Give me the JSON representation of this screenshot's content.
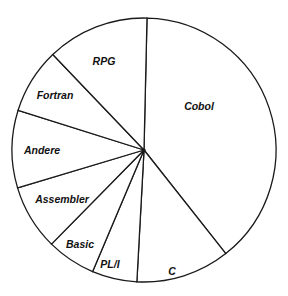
{
  "chart_data": {
    "type": "pie",
    "title": "",
    "start_angle_deg": 1.3,
    "direction": "clockwise",
    "legend": "none (labels inside slices)",
    "categories": [
      "Cobol",
      "C",
      "PL/I",
      "Basic",
      "Assembler",
      "Andere",
      "Fortran",
      "RPG"
    ],
    "values": [
      39,
      11.5,
      5.5,
      6,
      8,
      9.5,
      8,
      12.5
    ],
    "unit": "percent (estimated from slice angles)"
  },
  "style": {
    "fill": "#ffffff",
    "stroke": "#1a1a1a",
    "text_color": "#111111"
  },
  "geometry": {
    "cx": 144,
    "cy": 150,
    "r": 132
  },
  "labels": [
    {
      "text": "Cobol",
      "x": 199,
      "y": 110
    },
    {
      "text": "C",
      "x": 172,
      "y": 275
    },
    {
      "text": "PL/I",
      "x": 110,
      "y": 268
    },
    {
      "text": "Basic",
      "x": 80,
      "y": 248
    },
    {
      "text": "Assembler",
      "x": 62,
      "y": 203
    },
    {
      "text": "Andere",
      "x": 42,
      "y": 154
    },
    {
      "text": "Fortran",
      "x": 55,
      "y": 99
    },
    {
      "text": "RPG",
      "x": 104,
      "y": 65
    }
  ]
}
